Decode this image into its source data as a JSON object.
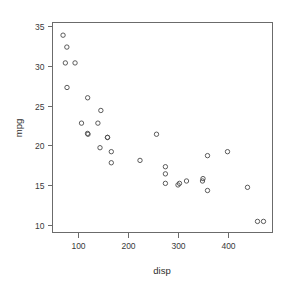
{
  "chart_data": {
    "type": "scatter",
    "title": "",
    "xlabel": "disp",
    "ylabel": "mpg",
    "xlim": [
      50,
      490
    ],
    "ylim": [
      9.0,
      35.5
    ],
    "grid": false,
    "legend": null,
    "xticks": [
      100,
      200,
      300,
      400
    ],
    "yticks": [
      10,
      15,
      20,
      25,
      30,
      35
    ],
    "xtick_labels": [
      "100",
      "200",
      "300",
      "400"
    ],
    "ytick_labels": [
      "10",
      "15",
      "20",
      "25",
      "30",
      "35"
    ],
    "marker": "open-circle",
    "marker_color": "#4a4a4a",
    "x": [
      160,
      160,
      108,
      258,
      360,
      225,
      360,
      146.7,
      140.8,
      167.6,
      167.6,
      275.8,
      275.8,
      275.8,
      472,
      460,
      440,
      78.7,
      75.7,
      71.1,
      120.1,
      318,
      304,
      350,
      400,
      79,
      120.3,
      95.1,
      351,
      145,
      301,
      121
    ],
    "y": [
      21.0,
      21.0,
      22.8,
      21.4,
      18.7,
      18.1,
      14.3,
      24.4,
      22.8,
      19.2,
      17.8,
      16.4,
      17.3,
      15.2,
      10.4,
      10.4,
      14.7,
      32.4,
      30.4,
      33.9,
      21.5,
      15.5,
      15.2,
      15.5,
      19.2,
      27.3,
      26.0,
      30.4,
      15.8,
      19.7,
      15.0,
      21.4
    ],
    "series": [
      {
        "name": "mtcars",
        "points": [
          {
            "x": 160,
            "y": 21.0
          },
          {
            "x": 160,
            "y": 21.0
          },
          {
            "x": 108,
            "y": 22.8
          },
          {
            "x": 258,
            "y": 21.4
          },
          {
            "x": 360,
            "y": 18.7
          },
          {
            "x": 225,
            "y": 18.1
          },
          {
            "x": 360,
            "y": 14.3
          },
          {
            "x": 146.7,
            "y": 24.4
          },
          {
            "x": 140.8,
            "y": 22.8
          },
          {
            "x": 167.6,
            "y": 19.2
          },
          {
            "x": 167.6,
            "y": 17.8
          },
          {
            "x": 275.8,
            "y": 16.4
          },
          {
            "x": 275.8,
            "y": 17.3
          },
          {
            "x": 275.8,
            "y": 15.2
          },
          {
            "x": 472,
            "y": 10.4
          },
          {
            "x": 460,
            "y": 10.4
          },
          {
            "x": 440,
            "y": 14.7
          },
          {
            "x": 78.7,
            "y": 32.4
          },
          {
            "x": 75.7,
            "y": 30.4
          },
          {
            "x": 71.1,
            "y": 33.9
          },
          {
            "x": 120.1,
            "y": 21.5
          },
          {
            "x": 318,
            "y": 15.5
          },
          {
            "x": 304,
            "y": 15.2
          },
          {
            "x": 350,
            "y": 15.5
          },
          {
            "x": 400,
            "y": 19.2
          },
          {
            "x": 79,
            "y": 27.3
          },
          {
            "x": 120.3,
            "y": 26.0
          },
          {
            "x": 95.1,
            "y": 30.4
          },
          {
            "x": 351,
            "y": 15.8
          },
          {
            "x": 145,
            "y": 19.7
          },
          {
            "x": 301,
            "y": 15.0
          },
          {
            "x": 121,
            "y": 21.4
          }
        ]
      }
    ]
  }
}
